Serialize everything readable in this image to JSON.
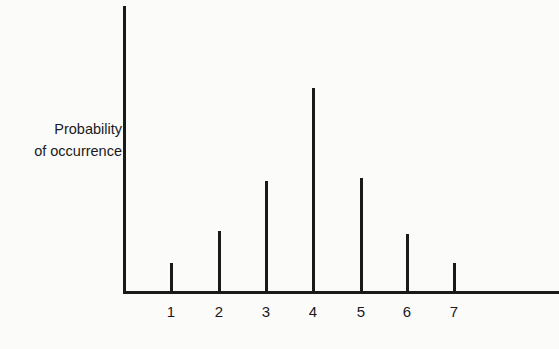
{
  "chart_data": {
    "type": "bar",
    "title": "",
    "xlabel": "",
    "ylabel": [
      "Probability",
      "of occurrence"
    ],
    "categories": [
      "1",
      "2",
      "3",
      "4",
      "5",
      "6",
      "7"
    ],
    "values": [
      29,
      61,
      111,
      204,
      114,
      58,
      29
    ],
    "relative_values": [
      1,
      2,
      4,
      7,
      4,
      2,
      1
    ],
    "ylim": [
      0,
      287
    ],
    "grid": false,
    "legend": null,
    "bar_x_px": [
      171,
      219,
      266,
      313,
      361,
      407,
      454
    ],
    "color": "#1a1a1a"
  }
}
